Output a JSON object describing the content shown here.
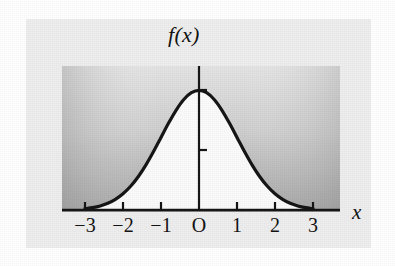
{
  "figure": {
    "kind": "normal-distribution-curve-figure",
    "background_color": "#ffffff",
    "panel_color": "#eeeeee"
  },
  "chart_data": {
    "type": "line",
    "title": "",
    "subtitle": "",
    "xlabel": "x",
    "ylabel": "f(x)",
    "xlim": [
      -3.6,
      -3.6
    ],
    "ylim": [
      0,
      0.47
    ],
    "grid": false,
    "legend": null,
    "annotations": [],
    "curve_description": "standard normal probability density function f(x)=1/sqrt(2*pi)*exp(-x^2/2)",
    "x_axis": {
      "label": "x",
      "tick_values": [
        -3,
        -2,
        -1,
        0,
        1,
        2,
        3
      ],
      "tick_labels": [
        "−3",
        "−2",
        "−1",
        "O",
        "1",
        "2",
        "3"
      ],
      "origin_label": "O"
    },
    "y_axis": {
      "label": "f(x)",
      "tick_values": [
        0.2,
        0.4
      ],
      "tick_labels": [
        "0.2",
        "0.4"
      ]
    },
    "series": [
      {
        "name": "f(x)",
        "color": "#161616",
        "line_width": 3,
        "fill_color": "#fbfbfb",
        "x": [
          -3.0,
          -2.8,
          -2.6,
          -2.4,
          -2.2,
          -2.0,
          -1.8,
          -1.6,
          -1.4,
          -1.2,
          -1.0,
          -0.8,
          -0.6,
          -0.4,
          -0.2,
          0.0,
          0.2,
          0.4,
          0.6,
          0.8,
          1.0,
          1.2,
          1.4,
          1.6,
          1.8,
          2.0,
          2.2,
          2.4,
          2.6,
          2.8,
          3.0
        ],
        "values": [
          0.0044,
          0.0079,
          0.0136,
          0.0224,
          0.0355,
          0.054,
          0.079,
          0.1109,
          0.1497,
          0.1942,
          0.242,
          0.2897,
          0.3332,
          0.3683,
          0.391,
          0.3989,
          0.391,
          0.3683,
          0.3332,
          0.2897,
          0.242,
          0.1942,
          0.1497,
          0.1109,
          0.079,
          0.054,
          0.0355,
          0.0224,
          0.0136,
          0.0079,
          0.0044
        ]
      }
    ],
    "shading": {
      "description": "gray gradient background inside plot box, darker toward bottom; region under the curve is white",
      "top_color": "#e2e2e2",
      "bottom_color": "#9f9f9f",
      "under_curve_color": "#fbfbfb"
    }
  }
}
